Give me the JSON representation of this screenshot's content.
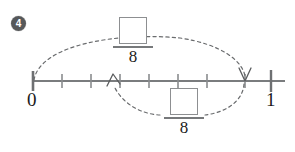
{
  "problem": {
    "number": "4",
    "badge_color": "#56585a"
  },
  "numberline": {
    "start_label": "0",
    "end_label": "1",
    "divisions": 8,
    "tick_count": 9,
    "axis_color": "#7a7c7e",
    "arrow_color": "#4a4c4e"
  },
  "top_fraction": {
    "numerator": "",
    "denominator": "8"
  },
  "bottom_fraction": {
    "numerator": "",
    "denominator": "8"
  },
  "arcs": {
    "top_arc_name": "dashed arc from 0 to 7/8 with arrowhead",
    "bottom_arc_name": "dashed arc from 7/8 back to 3/8 with arrowhead"
  }
}
